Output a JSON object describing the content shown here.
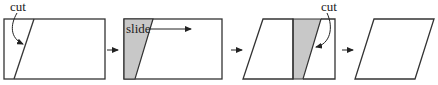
{
  "diagram": {
    "colors": {
      "shade": "#c8c8c8",
      "stroke": "#333333",
      "background": "#ffffff"
    },
    "steps": [
      {
        "id": "step-1",
        "shape": "rectangle with diagonal cut",
        "label": "cut"
      },
      {
        "id": "step-2",
        "shape": "rectangle with shaded cut piece",
        "label": "slide"
      },
      {
        "id": "step-3",
        "shape": "parallelogram with shaded piece moved to right",
        "label": "cut"
      },
      {
        "id": "step-4",
        "shape": "parallelogram",
        "label": ""
      }
    ],
    "transition_arrows": 3
  }
}
